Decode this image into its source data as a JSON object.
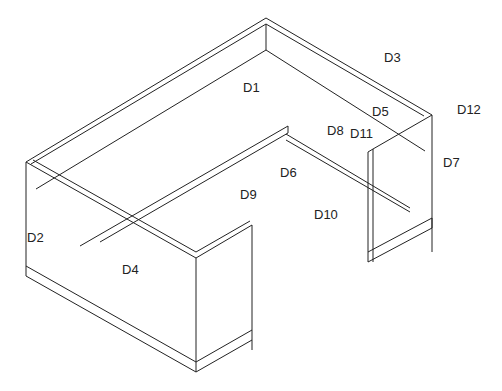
{
  "drawing": {
    "type": "isometric cabinet assembly",
    "labels": [
      {
        "id": "D1",
        "text": "D1",
        "x": 243,
        "y": 80
      },
      {
        "id": "D2",
        "text": "D2",
        "x": 27,
        "y": 230
      },
      {
        "id": "D3",
        "text": "D3",
        "x": 384,
        "y": 50
      },
      {
        "id": "D4",
        "text": "D4",
        "x": 122,
        "y": 262
      },
      {
        "id": "D5",
        "text": "D5",
        "x": 372,
        "y": 104
      },
      {
        "id": "D6",
        "text": "D6",
        "x": 280,
        "y": 165
      },
      {
        "id": "D7",
        "text": "D7",
        "x": 443,
        "y": 155
      },
      {
        "id": "D8",
        "text": "D8",
        "x": 327,
        "y": 123
      },
      {
        "id": "D9",
        "text": "D9",
        "x": 240,
        "y": 187
      },
      {
        "id": "D10",
        "text": "D10",
        "x": 314,
        "y": 207
      },
      {
        "id": "D11",
        "text": "D11",
        "x": 350,
        "y": 126
      },
      {
        "id": "D12",
        "text": "D12",
        "x": 457,
        "y": 102
      }
    ]
  }
}
